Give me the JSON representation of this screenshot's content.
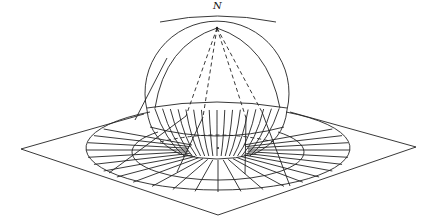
{
  "diagram": {
    "labels": {
      "north_pole": "N"
    },
    "colors": {
      "line": "#222222",
      "background": "#ffffff"
    },
    "elements": [
      "sphere",
      "equator band with meridians",
      "tangent plane (rhombus)",
      "outer projected circle",
      "inner projected circle",
      "radial meridian lines on plane",
      "projection rays from pole (dashed inside sphere)"
    ]
  }
}
